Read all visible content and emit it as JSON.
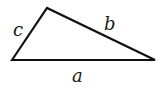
{
  "diagram": {
    "type": "triangle",
    "vertices": [
      [
        12,
        60
      ],
      [
        47,
        8
      ],
      [
        155,
        60
      ]
    ],
    "stroke_color": "#111111",
    "sides": [
      {
        "id": "a",
        "label": "a",
        "x": 72,
        "y": 82
      },
      {
        "id": "b",
        "label": "b",
        "x": 104,
        "y": 30
      },
      {
        "id": "c",
        "label": "c",
        "x": 13,
        "y": 36
      }
    ]
  }
}
